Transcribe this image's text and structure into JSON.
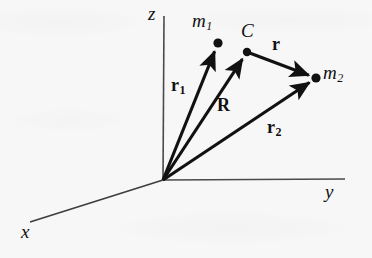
{
  "figure": {
    "name": "two-body-position-vectors",
    "caption_text": "",
    "background_color": "#f7f7f7",
    "ink_color": "#111111",
    "axes": [
      {
        "id": "z",
        "label": "z",
        "label_style": "italic",
        "from": [
          163,
          180
        ],
        "to": [
          164,
          16
        ],
        "label_pos": [
          148,
          5
        ]
      },
      {
        "id": "y",
        "label": "y",
        "label_style": "italic",
        "from": [
          163,
          180
        ],
        "to": [
          345,
          179
        ],
        "label_pos": [
          325,
          182
        ]
      },
      {
        "id": "x",
        "label": "x",
        "label_style": "italic",
        "from": [
          163,
          180
        ],
        "to": [
          30,
          222
        ],
        "label_pos": [
          22,
          224
        ]
      }
    ],
    "points": [
      {
        "id": "m1",
        "label": "m",
        "subscript": "1",
        "label_style": "italic",
        "at": [
          218,
          43
        ],
        "label_pos": [
          192,
          12
        ],
        "radius": 4.6
      },
      {
        "id": "C",
        "label": "C",
        "subscript": "",
        "label_style": "italic",
        "at": [
          247,
          52
        ],
        "label_pos": [
          241,
          22
        ],
        "radius": 4.2
      },
      {
        "id": "m2",
        "label": "m",
        "subscript": "2",
        "label_style": "italic",
        "at": [
          316,
          78
        ],
        "label_pos": [
          323,
          64
        ],
        "radius": 4.6
      }
    ],
    "vectors": [
      {
        "id": "r1",
        "label": "r",
        "subscript": "1",
        "label_style": "bold",
        "from": [
          163,
          180
        ],
        "to": [
          218,
          43
        ],
        "label_pos": [
          172,
          78
        ]
      },
      {
        "id": "R",
        "label": "R",
        "subscript": "",
        "label_style": "bold",
        "from": [
          163,
          180
        ],
        "to": [
          247,
          52
        ],
        "label_pos": [
          218,
          98
        ]
      },
      {
        "id": "r2",
        "label": "r",
        "subscript": "2",
        "label_style": "bold",
        "from": [
          163,
          180
        ],
        "to": [
          316,
          78
        ],
        "label_pos": [
          268,
          120
        ]
      },
      {
        "id": "r",
        "label": "r",
        "subscript": "",
        "label_style": "bold",
        "from": [
          247,
          52
        ],
        "to": [
          316,
          78
        ],
        "label_pos": [
          272,
          36
        ]
      }
    ]
  }
}
